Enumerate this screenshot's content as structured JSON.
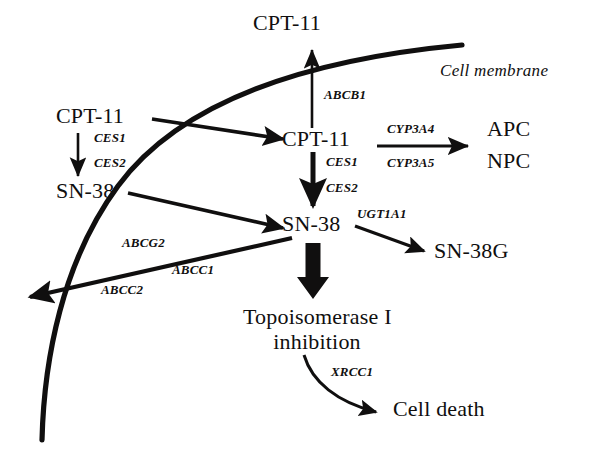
{
  "figure": {
    "background_color": "#ffffff",
    "ink_color": "#100f0f"
  },
  "membrane": {
    "label": "Cell membrane"
  },
  "compounds": {
    "cpt11_top": "CPT-11",
    "cpt11_outside": "CPT-11",
    "cpt11_inside": "CPT-11",
    "sn38_outside": "SN-38",
    "sn38_inside": "SN-38",
    "sn38g": "SN-38G",
    "apc": "APC",
    "npc": "NPC",
    "topo_line1": "Topoisomerase I",
    "topo_line2": "inhibition",
    "cell_death": "Cell death"
  },
  "genes": {
    "abcb1": "ABCB1",
    "ces1_outside": "CES1",
    "ces2_outside": "CES2",
    "ces1_inside": "CES1",
    "ces2_inside": "CES2",
    "cyp3a4": "CYP3A4",
    "cyp3a5": "CYP3A5",
    "ugt1a1": "UGT1A1",
    "abcg2": "ABCG2",
    "abcc1": "ABCC1",
    "abcc2": "ABCC2",
    "xrcc1": "XRCC1"
  },
  "reactions": [
    {
      "from": "CPT-11 (intracellular)",
      "to": "CPT-11 (extracellular)",
      "enzyme": "ABCB1",
      "kind": "efflux-transport"
    },
    {
      "from": "CPT-11 (extracellular)",
      "to": "SN-38 (extracellular)",
      "enzyme": "CES1 / CES2",
      "kind": "conversion"
    },
    {
      "from": "CPT-11 (extracellular)",
      "to": "CPT-11 (intracellular)",
      "enzyme": "",
      "kind": "uptake"
    },
    {
      "from": "SN-38 (extracellular)",
      "to": "SN-38 (intracellular)",
      "enzyme": "",
      "kind": "uptake"
    },
    {
      "from": "CPT-11 (intracellular)",
      "to": "SN-38 (intracellular)",
      "enzyme": "CES1 / CES2",
      "kind": "conversion"
    },
    {
      "from": "CPT-11 (intracellular)",
      "to": "APC / NPC",
      "enzyme": "CYP3A4 / CYP3A5",
      "kind": "oxidation"
    },
    {
      "from": "SN-38 (intracellular)",
      "to": "SN-38G",
      "enzyme": "UGT1A1",
      "kind": "glucuronidation"
    },
    {
      "from": "SN-38 (intracellular)",
      "to": "extracellular space",
      "enzyme": "ABCG2 / ABCC1 / ABCC2",
      "kind": "efflux-transport"
    },
    {
      "from": "SN-38 (intracellular)",
      "to": "Topoisomerase I inhibition",
      "enzyme": "",
      "kind": "effect"
    },
    {
      "from": "Topoisomerase I inhibition",
      "to": "Cell death",
      "enzyme": "XRCC1",
      "kind": "outcome"
    }
  ]
}
